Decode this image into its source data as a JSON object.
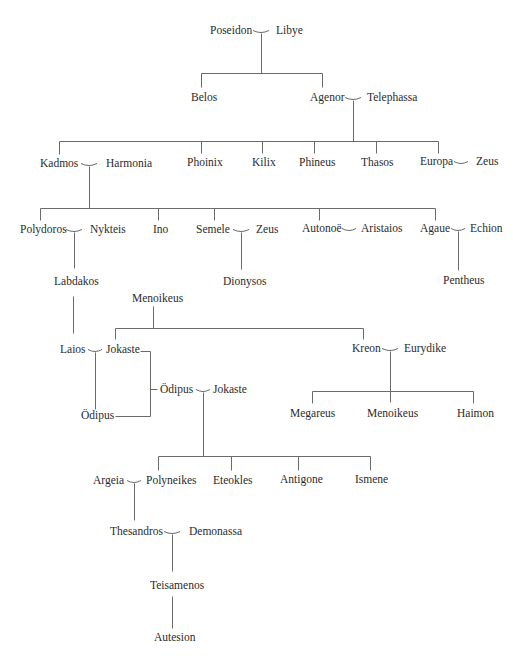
{
  "diagram": {
    "type": "genealogy",
    "title_fragment": "",
    "line_color": "#6a6a6a",
    "text_color": "#2b2b2b",
    "people": [
      {
        "id": "poseidon",
        "label": "Poseidon",
        "x": 210,
        "y": 31
      },
      {
        "id": "libye",
        "label": "Libye",
        "x": 276,
        "y": 31
      },
      {
        "id": "belos",
        "label": "Belos",
        "x": 191,
        "y": 98
      },
      {
        "id": "agenor",
        "label": "Agenor",
        "x": 310,
        "y": 98
      },
      {
        "id": "telephassa",
        "label": "Telephassa",
        "x": 367,
        "y": 98
      },
      {
        "id": "kadmos",
        "label": "Kadmos",
        "x": 40,
        "y": 164
      },
      {
        "id": "harmonia",
        "label": "Harmonia",
        "x": 106,
        "y": 164
      },
      {
        "id": "phoinix",
        "label": "Phoinix",
        "x": 187,
        "y": 163
      },
      {
        "id": "kilix",
        "label": "Kilix",
        "x": 252,
        "y": 163
      },
      {
        "id": "phineus",
        "label": "Phineus",
        "x": 299,
        "y": 163
      },
      {
        "id": "thasos",
        "label": "Thasos",
        "x": 361,
        "y": 163
      },
      {
        "id": "europa",
        "label": "Europa",
        "x": 420,
        "y": 162
      },
      {
        "id": "zeus-1",
        "label": "Zeus",
        "x": 476,
        "y": 162
      },
      {
        "id": "polydoros",
        "label": "Polydoros",
        "x": 20,
        "y": 230
      },
      {
        "id": "nykteis",
        "label": "Nykteis",
        "x": 90,
        "y": 230
      },
      {
        "id": "ino",
        "label": "Ino",
        "x": 153,
        "y": 230
      },
      {
        "id": "semele",
        "label": "Semele",
        "x": 196,
        "y": 230
      },
      {
        "id": "zeus-2",
        "label": "Zeus",
        "x": 256,
        "y": 230
      },
      {
        "id": "autonoe",
        "label": "Autonoë",
        "x": 302,
        "y": 229
      },
      {
        "id": "aristaios",
        "label": "Aristaios",
        "x": 361,
        "y": 229
      },
      {
        "id": "agaue",
        "label": "Agaue",
        "x": 420,
        "y": 229
      },
      {
        "id": "echion",
        "label": "Echion",
        "x": 470,
        "y": 229
      },
      {
        "id": "labdakos",
        "label": "Labdakos",
        "x": 54,
        "y": 282
      },
      {
        "id": "dionysos",
        "label": "Dionysos",
        "x": 223,
        "y": 282
      },
      {
        "id": "pentheus",
        "label": "Pentheus",
        "x": 443,
        "y": 281
      },
      {
        "id": "menoikeus-1",
        "label": "Menoikeus",
        "x": 132,
        "y": 299
      },
      {
        "id": "laios",
        "label": "Laios",
        "x": 60,
        "y": 350
      },
      {
        "id": "jokaste-1",
        "label": "Jokaste",
        "x": 106,
        "y": 350
      },
      {
        "id": "kreon",
        "label": "Kreon",
        "x": 352,
        "y": 349
      },
      {
        "id": "eurydike",
        "label": "Eurydike",
        "x": 404,
        "y": 349
      },
      {
        "id": "oedipus-2",
        "label": "Ödipus",
        "x": 160,
        "y": 390
      },
      {
        "id": "jokaste-2",
        "label": "Jokaste",
        "x": 213,
        "y": 390
      },
      {
        "id": "oedipus-1",
        "label": "Ödipus",
        "x": 81,
        "y": 416
      },
      {
        "id": "megareus",
        "label": "Megareus",
        "x": 290,
        "y": 414
      },
      {
        "id": "menoikeus-2",
        "label": "Menoikeus",
        "x": 367,
        "y": 414
      },
      {
        "id": "haimon",
        "label": "Haimon",
        "x": 457,
        "y": 414
      },
      {
        "id": "argeia",
        "label": "Argeia",
        "x": 93,
        "y": 481
      },
      {
        "id": "polyneikes",
        "label": "Polyneikes",
        "x": 146,
        "y": 481
      },
      {
        "id": "eteokles",
        "label": "Eteokles",
        "x": 213,
        "y": 481
      },
      {
        "id": "antigone",
        "label": "Antigone",
        "x": 280,
        "y": 480
      },
      {
        "id": "ismene",
        "label": "Ismene",
        "x": 355,
        "y": 480
      },
      {
        "id": "thesandros",
        "label": "Thesandros",
        "x": 110,
        "y": 532
      },
      {
        "id": "demonassa",
        "label": "Demonassa",
        "x": 189,
        "y": 532
      },
      {
        "id": "teisamenos",
        "label": "Teisamenos",
        "x": 150,
        "y": 586
      },
      {
        "id": "autesion",
        "label": "Autesion",
        "x": 154,
        "y": 638
      }
    ],
    "marriages": [
      {
        "between": [
          "Poseidon",
          "Libye"
        ],
        "cx": 261,
        "y": 31,
        "w": 16
      },
      {
        "between": [
          "Agenor",
          "Telephassa"
        ],
        "cx": 353,
        "y": 98,
        "w": 16
      },
      {
        "between": [
          "Kadmos",
          "Harmonia"
        ],
        "cx": 89,
        "y": 164,
        "w": 16
      },
      {
        "between": [
          "Europa",
          "Zeus"
        ],
        "cx": 461,
        "y": 162,
        "w": 14
      },
      {
        "between": [
          "Polydoros",
          "Nykteis"
        ],
        "cx": 74,
        "y": 230,
        "w": 16
      },
      {
        "between": [
          "Semele",
          "Zeus"
        ],
        "cx": 241,
        "y": 230,
        "w": 16
      },
      {
        "between": [
          "Autonoë",
          "Aristaios"
        ],
        "cx": 349,
        "y": 229,
        "w": 14
      },
      {
        "between": [
          "Agaue",
          "Echion"
        ],
        "cx": 458,
        "y": 229,
        "w": 14
      },
      {
        "between": [
          "Laios",
          "Jokaste"
        ],
        "cx": 95,
        "y": 350,
        "w": 14
      },
      {
        "between": [
          "Kreon",
          "Eurydike"
        ],
        "cx": 390,
        "y": 349,
        "w": 16
      },
      {
        "between": [
          "Ödipus",
          "Jokaste"
        ],
        "cx": 203,
        "y": 390,
        "w": 14
      },
      {
        "between": [
          "Argeia",
          "Polyneikes"
        ],
        "cx": 134,
        "y": 481,
        "w": 14
      },
      {
        "between": [
          "Thesandros",
          "Demonassa"
        ],
        "cx": 172,
        "y": 532,
        "w": 16
      }
    ],
    "segments": [
      [
        261,
        33,
        261,
        73
      ],
      [
        201,
        73,
        322,
        73
      ],
      [
        201,
        73,
        201,
        87
      ],
      [
        322,
        73,
        322,
        87
      ],
      [
        353,
        100,
        353,
        141
      ],
      [
        59,
        141,
        438,
        141
      ],
      [
        59,
        141,
        59,
        154
      ],
      [
        201,
        141,
        201,
        153
      ],
      [
        262,
        141,
        262,
        153
      ],
      [
        314,
        141,
        314,
        153
      ],
      [
        376,
        141,
        376,
        153
      ],
      [
        438,
        141,
        438,
        153
      ],
      [
        89,
        166,
        89,
        208
      ],
      [
        40,
        208,
        435,
        208
      ],
      [
        40,
        208,
        40,
        220
      ],
      [
        158,
        208,
        158,
        220
      ],
      [
        214,
        208,
        214,
        220
      ],
      [
        319,
        208,
        319,
        220
      ],
      [
        435,
        208,
        435,
        220
      ],
      [
        74,
        232,
        74,
        268
      ],
      [
        241,
        232,
        241,
        269
      ],
      [
        458,
        231,
        458,
        270
      ],
      [
        73,
        296,
        73,
        333
      ],
      [
        153,
        306,
        153,
        328
      ],
      [
        115,
        328,
        363,
        328
      ],
      [
        115,
        328,
        115,
        339
      ],
      [
        363,
        328,
        363,
        339
      ],
      [
        95,
        352,
        95,
        409
      ],
      [
        140,
        351,
        150,
        351
      ],
      [
        150,
        351,
        150,
        416
      ],
      [
        150,
        416,
        115,
        416
      ],
      [
        150,
        389,
        157,
        389
      ],
      [
        390,
        351,
        390,
        402
      ],
      [
        312,
        391,
        473,
        391
      ],
      [
        312,
        391,
        312,
        403
      ],
      [
        473,
        391,
        473,
        403
      ],
      [
        203,
        392,
        203,
        456
      ],
      [
        158,
        456,
        370,
        456
      ],
      [
        158,
        456,
        158,
        470
      ],
      [
        231,
        456,
        231,
        470
      ],
      [
        298,
        456,
        298,
        470
      ],
      [
        370,
        456,
        370,
        470
      ],
      [
        134,
        483,
        134,
        520
      ],
      [
        172,
        534,
        172,
        571
      ],
      [
        172,
        596,
        172,
        628
      ]
    ]
  }
}
